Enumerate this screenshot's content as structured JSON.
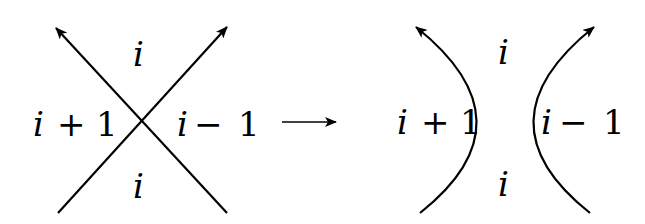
{
  "diagram": {
    "before": {
      "top_label": "i",
      "bottom_label": "i",
      "left_label_var": "i",
      "left_label_op": "+",
      "left_label_num": "1",
      "right_label_var": "i",
      "right_label_op": "−",
      "right_label_num": "1"
    },
    "transition_arrow": "→",
    "after": {
      "top_label": "i",
      "bottom_label": "i",
      "left_label_var": "i",
      "left_label_op": "+",
      "left_label_num": "1",
      "right_label_var": "i",
      "right_label_op": "−",
      "right_label_num": "1"
    },
    "colors": {
      "stroke": "#000000",
      "background": "#ffffff"
    }
  }
}
